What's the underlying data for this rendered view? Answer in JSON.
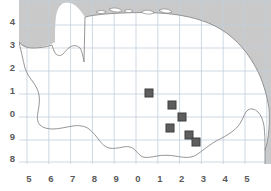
{
  "figure": {
    "name": "species-distribution-map",
    "type": "distribution-map"
  },
  "colors": {
    "sea": "#c9c9c9",
    "land": "#ffffff",
    "coastline": "#8a8a8a",
    "grid": "#c3cfdd",
    "marker": "#5e5e5e",
    "marker_border": "#3f3f3f",
    "axis_text": "#5a5a5a",
    "background": "#ffffff"
  },
  "axes": {
    "x_ticks": [
      {
        "label": "5",
        "x": 27
      },
      {
        "label": "6",
        "x": 48
      },
      {
        "label": "7",
        "x": 70
      },
      {
        "label": "8",
        "x": 92
      },
      {
        "label": "9",
        "x": 113
      },
      {
        "label": "0",
        "x": 135
      },
      {
        "label": "1",
        "x": 157
      },
      {
        "label": "2",
        "x": 179
      },
      {
        "label": "3",
        "x": 200
      },
      {
        "label": "4",
        "x": 222
      },
      {
        "label": "5",
        "x": 244
      }
    ],
    "y_ticks": [
      {
        "label": "4",
        "y": 22
      },
      {
        "label": "3",
        "y": 45
      },
      {
        "label": "2",
        "y": 68
      },
      {
        "label": "1",
        "y": 91
      },
      {
        "label": "0",
        "y": 114
      },
      {
        "label": "9",
        "y": 137
      },
      {
        "label": "8",
        "y": 159
      }
    ],
    "x_label": "",
    "y_label": ""
  },
  "chart_data": {
    "type": "scatter",
    "title": "",
    "subtitle": "",
    "xlabel": "",
    "ylabel": "",
    "grid": true,
    "legend": "none",
    "x_tick_labels": [
      "5",
      "6",
      "7",
      "8",
      "9",
      "0",
      "1",
      "2",
      "3",
      "4",
      "5"
    ],
    "y_tick_labels": [
      "4",
      "3",
      "2",
      "1",
      "0",
      "9",
      "8"
    ],
    "xlim": [
      0,
      252
    ],
    "ylim": [
      0,
      164
    ],
    "marker_shape": "square",
    "marker_size_px": 8,
    "series": [
      {
        "name": "records",
        "points": [
          {
            "px": 130,
            "py": 93
          },
          {
            "px": 153,
            "py": 105
          },
          {
            "px": 163,
            "py": 117
          },
          {
            "px": 151,
            "py": 128
          },
          {
            "px": 170,
            "py": 135
          },
          {
            "px": 177,
            "py": 142
          }
        ]
      }
    ],
    "point_count": 6
  },
  "geometry": {
    "sea_note": "shaded sea surrounds land mass top, left and right",
    "land_note": "white landmass with thin gray coastline",
    "islands_count": 5
  }
}
